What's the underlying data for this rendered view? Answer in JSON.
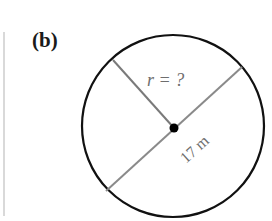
{
  "figure": {
    "part_label": "(b)",
    "radius_label": "r = ?",
    "diameter_label": "17 m",
    "colors": {
      "circle_stroke": "#111111",
      "segment_stroke": "#7a7a7a",
      "center_dot": "#000000",
      "label_text": "#6e6e6e",
      "left_rule": "#d9d9d9"
    },
    "geometry": {
      "circle": {
        "cx": 173,
        "cy": 126,
        "r": 91
      },
      "center_dot": {
        "cx": 174,
        "cy": 128,
        "r": 4
      },
      "radius_segment": {
        "x1": 113,
        "y1": 60,
        "x2": 174,
        "y2": 128
      },
      "diameter_segment": {
        "x1": 106,
        "y1": 191,
        "x2": 242,
        "y2": 67
      }
    }
  }
}
